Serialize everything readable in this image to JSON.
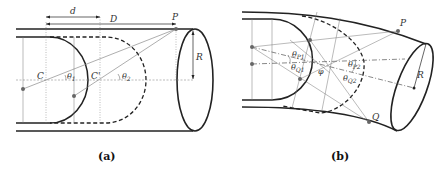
{
  "panel_a": {
    "caption": "(a)",
    "labels": {
      "d": "d",
      "D": "D",
      "P": "P",
      "R": "R",
      "C": "C",
      "C_prime": "C'",
      "theta1": "θ",
      "theta1_sub": "1",
      "theta2": "θ",
      "theta2_sub": "2"
    }
  },
  "panel_b": {
    "caption": "(b)",
    "labels": {
      "P": "P",
      "Q": "Q",
      "R": "R",
      "phi": "φ",
      "thetaP1": "θ",
      "thetaP1_sub": "P1",
      "thetaQ1": "θ",
      "thetaQ1_sub": "Q1",
      "thetaP2": "θ",
      "thetaP2_sub": "P2",
      "thetaQ2": "θ",
      "thetaQ2_sub": "Q2"
    }
  },
  "colors": {
    "stroke": "#222222",
    "thin": "#777777",
    "point": "#666666"
  }
}
